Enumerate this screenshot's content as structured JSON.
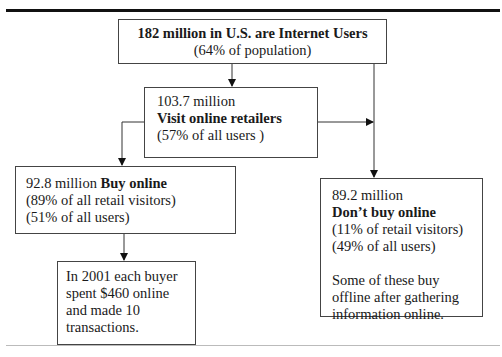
{
  "diagram": {
    "nodes": {
      "internet_users": {
        "title": "182 million in U.S. are Internet Users",
        "subtitle": "(64% of population)"
      },
      "visit_retailers": {
        "count": "103.7 million",
        "label": "Visit online retailers",
        "share": "(57% of all users )"
      },
      "buy_online": {
        "count": "92.8 million",
        "label": "Buy online",
        "share_visitors": "(89% of all retail visitors)",
        "share_users": "(51% of all users)"
      },
      "buyer_spend": {
        "lines": [
          "In 2001 each buyer",
          "spent $460 online",
          "and made 10",
          "transactions."
        ]
      },
      "dont_buy_online": {
        "count": "89.2 million",
        "label": "Don’t buy online",
        "share_visitors": "(11% of retail visitors)",
        "share_users": "(49% of all users)",
        "note_lines": [
          "Some of these buy",
          "offline after gathering",
          "information online."
        ]
      }
    },
    "edges": [
      {
        "from": "internet_users",
        "to": "visit_retailers"
      },
      {
        "from": "internet_users",
        "to": "dont_buy_online"
      },
      {
        "from": "visit_retailers",
        "to": "dont_buy_online"
      },
      {
        "from": "visit_retailers",
        "to": "buy_online"
      },
      {
        "from": "buy_online",
        "to": "buyer_spend"
      }
    ]
  }
}
